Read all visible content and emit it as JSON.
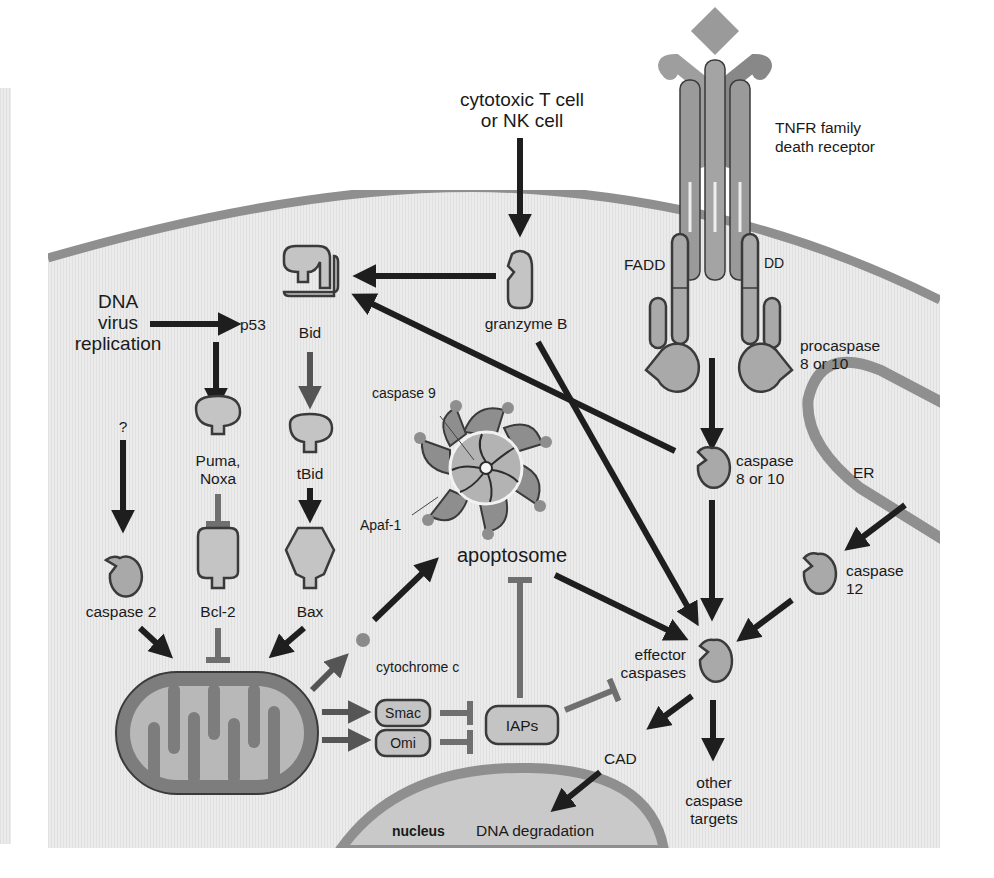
{
  "diagram": {
    "colors": {
      "page_background": "#ffffff",
      "cytoplasm": "#e9e9e9",
      "membrane": "#8f8f8f",
      "protein_fill": "#a9a9a9",
      "protein_light_fill": "#c4c4c4",
      "outline": "#3a3a3a",
      "activation_arrow": "#1e1e1e",
      "inhibition_line": "#6f6f6f"
    },
    "labels": {
      "killer_cell": [
        "cytotoxic T cell",
        "or NK cell"
      ],
      "death_receptor": [
        "TNFR family",
        "death receptor"
      ],
      "fadd": "FADD",
      "dd": "DD",
      "procaspase": [
        "procaspase",
        "8 or 10"
      ],
      "granzyme": "granzyme B",
      "bid": "Bid",
      "tbid": "tBid",
      "bax": "Bax",
      "dna_virus": [
        "DNA",
        "virus",
        "replication"
      ],
      "p53": "p53",
      "puma_noxa": [
        "Puma,",
        "Noxa"
      ],
      "bcl2": "Bcl-2",
      "question": "?",
      "caspase2": "caspase 2",
      "caspase9": "caspase 9",
      "apaf1": "Apaf-1",
      "apoptosome": "apoptosome",
      "caspase8": [
        "caspase",
        "8 or 10"
      ],
      "er": "ER",
      "caspase12": [
        "caspase",
        "12"
      ],
      "effector": [
        "effector",
        "caspases"
      ],
      "cytochrome": "cytochrome c",
      "smac": "Smac",
      "omi": "Omi",
      "iaps": "IAPs",
      "cad": "CAD",
      "other_targets": [
        "other",
        "caspase",
        "targets"
      ],
      "nucleus": "nucleus",
      "dna_degradation": "DNA degradation"
    },
    "relations": [
      {
        "from": "cytotoxic T cell or NK cell",
        "to": "granzyme B",
        "type": "activates"
      },
      {
        "from": "granzyme B",
        "to": "Bid",
        "type": "activates"
      },
      {
        "from": "granzyme B",
        "to": "effector caspases",
        "type": "activates"
      },
      {
        "from": "TNFR family death receptor",
        "to": "procaspase 8 or 10",
        "type": "recruits via FADD"
      },
      {
        "from": "procaspase 8 or 10",
        "to": "caspase 8 or 10",
        "type": "activates"
      },
      {
        "from": "caspase 8 or 10",
        "to": "Bid",
        "type": "activates"
      },
      {
        "from": "caspase 8 or 10",
        "to": "effector caspases",
        "type": "activates"
      },
      {
        "from": "DNA virus replication",
        "to": "p53",
        "type": "activates"
      },
      {
        "from": "p53",
        "to": "Puma, Noxa",
        "type": "activates"
      },
      {
        "from": "Puma, Noxa",
        "to": "Bcl-2",
        "type": "inhibits"
      },
      {
        "from": "Bid",
        "to": "tBid",
        "type": "cleaved"
      },
      {
        "from": "tBid",
        "to": "Bax",
        "type": "activates"
      },
      {
        "from": "?",
        "to": "caspase 2",
        "type": "activates"
      },
      {
        "from": "caspase 2",
        "to": "mitochondrion",
        "type": "activates"
      },
      {
        "from": "Bcl-2",
        "to": "mitochondrion",
        "type": "inhibits"
      },
      {
        "from": "Bax",
        "to": "mitochondrion",
        "type": "activates"
      },
      {
        "from": "mitochondrion",
        "to": "cytochrome c",
        "type": "releases"
      },
      {
        "from": "cytochrome c",
        "to": "apoptosome",
        "type": "activates"
      },
      {
        "from": "mitochondrion",
        "to": "Smac",
        "type": "releases"
      },
      {
        "from": "mitochondrion",
        "to": "Omi",
        "type": "releases"
      },
      {
        "from": "Smac",
        "to": "IAPs",
        "type": "inhibits"
      },
      {
        "from": "Omi",
        "to": "IAPs",
        "type": "inhibits"
      },
      {
        "from": "IAPs",
        "to": "apoptosome",
        "type": "inhibits"
      },
      {
        "from": "IAPs",
        "to": "effector caspases",
        "type": "inhibits"
      },
      {
        "from": "apoptosome",
        "to": "effector caspases",
        "type": "activates"
      },
      {
        "from": "ER",
        "to": "caspase 12",
        "type": "activates"
      },
      {
        "from": "caspase 12",
        "to": "effector caspases",
        "type": "activates"
      },
      {
        "from": "effector caspases",
        "to": "CAD",
        "type": "activates"
      },
      {
        "from": "effector caspases",
        "to": "other caspase targets",
        "type": "activates"
      },
      {
        "from": "CAD",
        "to": "DNA degradation",
        "type": "causes"
      }
    ]
  }
}
